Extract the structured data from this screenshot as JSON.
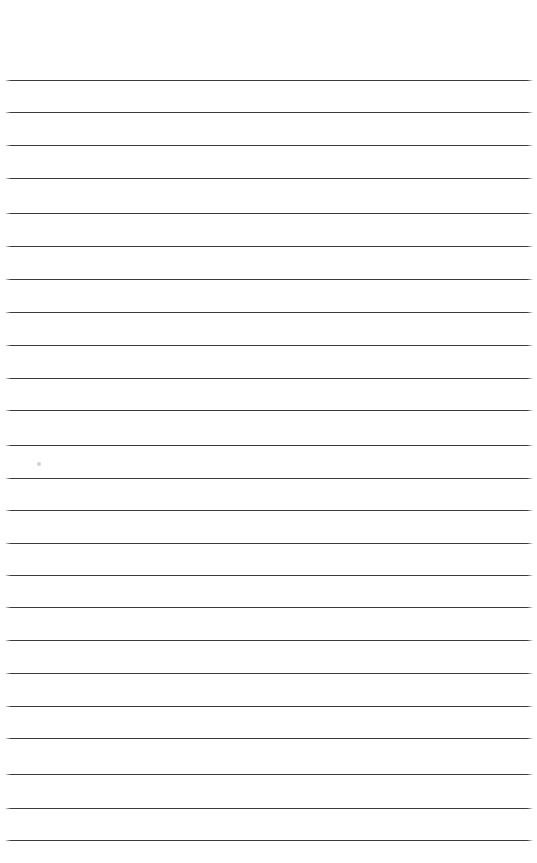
{
  "document": {
    "kind": "scanned-lined-notebook-page",
    "title": "Blank Ruled Notebook Page",
    "page_width": 537,
    "page_height": 863,
    "background_color": "#ffffff",
    "written_text": "",
    "visible_text_content": []
  },
  "paper": {
    "rule_color": "#3b3b3d",
    "rule_thickness_px": 1.4,
    "rule_left_x": 5,
    "rule_right_x": 533,
    "rule_length_px": 528,
    "line_spacing_px": 32.9,
    "line_count": 24,
    "first_line_y": 80,
    "last_line_y": 840,
    "top_margin_px": 80,
    "bottom_margin_px": 23,
    "left_margin_px": 5,
    "right_margin_px": 4,
    "ruling_style": "wide-ruled",
    "has_vertical_margin_rule": false,
    "has_holes": false
  },
  "lines": [
    {
      "index": 1,
      "y": 80
    },
    {
      "index": 2,
      "y": 112
    },
    {
      "index": 3,
      "y": 145
    },
    {
      "index": 4,
      "y": 178
    },
    {
      "index": 5,
      "y": 213
    },
    {
      "index": 6,
      "y": 246
    },
    {
      "index": 7,
      "y": 279
    },
    {
      "index": 8,
      "y": 312
    },
    {
      "index": 9,
      "y": 345
    },
    {
      "index": 10,
      "y": 378
    },
    {
      "index": 11,
      "y": 410
    },
    {
      "index": 12,
      "y": 445
    },
    {
      "index": 13,
      "y": 478
    },
    {
      "index": 14,
      "y": 510
    },
    {
      "index": 15,
      "y": 543
    },
    {
      "index": 16,
      "y": 575
    },
    {
      "index": 17,
      "y": 607
    },
    {
      "index": 18,
      "y": 640
    },
    {
      "index": 19,
      "y": 673
    },
    {
      "index": 20,
      "y": 706
    },
    {
      "index": 21,
      "y": 738
    },
    {
      "index": 22,
      "y": 774
    },
    {
      "index": 23,
      "y": 808
    },
    {
      "index": 24,
      "y": 840
    }
  ],
  "marks": [
    {
      "name": "faint-pencil-smudge",
      "x": 37,
      "y": 462,
      "width": 4,
      "height": 4,
      "color": "#828286"
    }
  ]
}
